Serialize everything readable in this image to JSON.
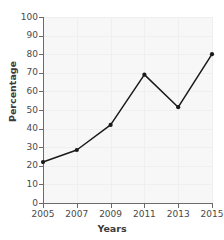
{
  "chart_data": {
    "type": "line",
    "title": "",
    "xlabel": "Years",
    "ylabel": "Percentage",
    "categories": [
      "2005",
      "2007",
      "2009",
      "2011",
      "2013",
      "2015"
    ],
    "x": [
      2005,
      2007,
      2009,
      2011,
      2013,
      2015
    ],
    "values": [
      22,
      28.5,
      42,
      69,
      51.5,
      80
    ],
    "series": [
      {
        "name": "Percentage",
        "values": [
          22,
          28.5,
          42,
          69,
          51.5,
          80
        ]
      }
    ],
    "xlim": [
      2005,
      2015
    ],
    "ylim": [
      0,
      100
    ],
    "ytick_labels": [
      "0",
      "10",
      "20",
      "30",
      "40",
      "50",
      "60",
      "70",
      "80",
      "90",
      "100"
    ],
    "ytick_values": [
      0,
      10,
      20,
      30,
      40,
      50,
      60,
      70,
      80,
      90,
      100
    ],
    "xtick_labels": [
      "2005",
      "2007",
      "2009",
      "2011",
      "2013",
      "2015"
    ],
    "grid": true,
    "legend": "none",
    "marker": "filled-circle",
    "line_color": "#1a1a1a",
    "marker_color": "#1a1a1a",
    "plot_background": "#f7f7f7",
    "grid_color": "#efefef",
    "axis_color": "#6b6b6b"
  }
}
